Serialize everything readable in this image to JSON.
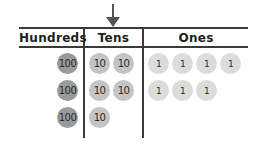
{
  "columns": [
    {
      "label": "Hundreds"
    },
    {
      "label": "Tens"
    },
    {
      "label": "Ones"
    }
  ],
  "arrow": {
    "points_to": "Tens",
    "icon": "down-arrow-icon"
  },
  "rows": [
    {
      "hundreds": [
        "100"
      ],
      "tens": [
        "10",
        "10"
      ],
      "ones": [
        "1",
        "1",
        "1",
        "1"
      ]
    },
    {
      "hundreds": [
        "100"
      ],
      "tens": [
        "10",
        "10"
      ],
      "ones": [
        "1",
        "1",
        "1"
      ]
    },
    {
      "hundreds": [
        "100"
      ],
      "tens": [
        "10"
      ],
      "ones": []
    }
  ],
  "colors": {
    "hundreds_chip": "#9a9a9a",
    "tens_chip": "#c4c4c4",
    "ones_chip": "#dcdcdc",
    "lines": "#3a3a3a"
  }
}
